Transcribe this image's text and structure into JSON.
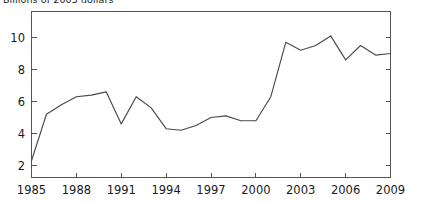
{
  "chart_data": {
    "type": "line",
    "title": "Billions of 2005 dollars",
    "xlabel": "",
    "ylabel": "",
    "x": [
      1985,
      1986,
      1987,
      1988,
      1989,
      1990,
      1991,
      1992,
      1993,
      1994,
      1995,
      1996,
      1997,
      1998,
      1999,
      2000,
      2001,
      2002,
      2003,
      2004,
      2005,
      2006,
      2007,
      2008,
      2009
    ],
    "values": [
      2.3,
      5.2,
      5.8,
      6.3,
      6.4,
      6.6,
      4.6,
      6.3,
      5.6,
      4.3,
      4.2,
      4.5,
      5.0,
      5.1,
      4.8,
      4.8,
      6.3,
      9.7,
      9.2,
      9.5,
      10.1,
      8.6,
      9.5,
      8.9,
      9.0
    ],
    "series": [
      {
        "name": "",
        "values": [
          2.3,
          5.2,
          5.8,
          6.3,
          6.4,
          6.6,
          4.6,
          6.3,
          5.6,
          4.3,
          4.2,
          4.5,
          5.0,
          5.1,
          4.8,
          4.8,
          6.3,
          9.7,
          9.2,
          9.5,
          10.1,
          8.6,
          9.5,
          8.9,
          9.0
        ],
        "color": "#4a4a4a"
      }
    ],
    "xlim": [
      1985,
      2009
    ],
    "ylim": [
      1.0,
      11.0
    ],
    "x_ticks": [
      1985,
      1988,
      1991,
      1994,
      1997,
      2000,
      2003,
      2006,
      2009
    ],
    "x_tick_labels": [
      "1985",
      "1988",
      "1991",
      "1994",
      "1997",
      "2000",
      "2003",
      "2006",
      "2009"
    ],
    "y_ticks": [
      2,
      4,
      6,
      8,
      10
    ],
    "y_tick_labels": [
      "2",
      "4",
      "6",
      "8",
      "10"
    ],
    "grid": false,
    "legend": false,
    "legend_position": "none",
    "frame": "box",
    "line_color": "#4a4a4a",
    "axis_color": "#555555",
    "background_color": "#ffffff"
  }
}
